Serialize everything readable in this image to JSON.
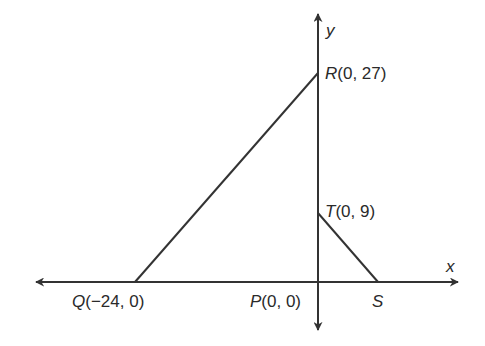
{
  "diagram": {
    "type": "coordinate-geometry",
    "axes": {
      "x_label": "x",
      "y_label": "y"
    },
    "points": [
      {
        "name": "R",
        "coords": "(0, 27)",
        "x": 0,
        "y": 27
      },
      {
        "name": "T",
        "coords": "(0, 9)",
        "x": 0,
        "y": 9
      },
      {
        "name": "Q",
        "coords": "(−24, 0)",
        "x": -24,
        "y": 0
      },
      {
        "name": "P",
        "coords": "(0, 0)",
        "x": 0,
        "y": 0
      },
      {
        "name": "S",
        "coords": "",
        "x": null,
        "y": 0
      }
    ],
    "segments": [
      [
        "Q",
        "R"
      ],
      [
        "T",
        "S"
      ]
    ],
    "line_color": "#333333"
  }
}
